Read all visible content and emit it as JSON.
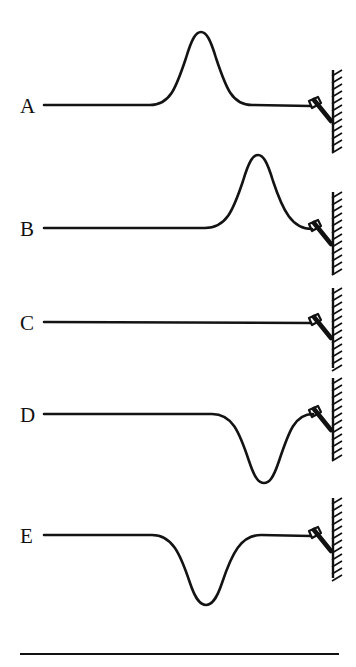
{
  "figure": {
    "width": 356,
    "height": 667,
    "background_color": "#ffffff",
    "line_color": "#131313",
    "wall": {
      "name": "fixed-wall",
      "x": 333,
      "hatch_side": "left",
      "segments": [
        {
          "row": "A",
          "top": 70,
          "bottom": 152
        },
        {
          "row": "B",
          "top": 192,
          "bottom": 275
        },
        {
          "row": "C",
          "top": 288,
          "bottom": 368
        },
        {
          "row": "D",
          "top": 378,
          "bottom": 460
        },
        {
          "row": "E",
          "top": 498,
          "bottom": 578
        }
      ]
    },
    "bottom_rule": {
      "x1": 20,
      "x2": 339,
      "y": 654
    },
    "rows": [
      {
        "label": "A",
        "label_x": 20,
        "label_y": 113,
        "baseline_y": 105,
        "rope_start_x": 44,
        "attach_x": 311,
        "attach_y": 106,
        "pulse": {
          "type": "crest",
          "polarity": "upward",
          "start_x": 150,
          "end_x": 252,
          "peak_x": 201,
          "peak_y": 32,
          "amplitude": 73,
          "width": 102
        }
      },
      {
        "label": "B",
        "label_x": 20,
        "label_y": 236,
        "baseline_y": 228,
        "rope_start_x": 44,
        "attach_x": 311,
        "attach_y": 229,
        "pulse": {
          "type": "crest",
          "polarity": "upward",
          "start_x": 205,
          "end_x": 312,
          "peak_x": 258,
          "peak_y": 155,
          "amplitude": 73,
          "width": 107
        }
      },
      {
        "label": "C",
        "label_x": 20,
        "label_y": 330,
        "baseline_y": 322,
        "rope_start_x": 44,
        "attach_x": 311,
        "attach_y": 323,
        "pulse": {
          "type": "none",
          "polarity": "flat",
          "amplitude": 0,
          "width": 0
        }
      },
      {
        "label": "D",
        "label_x": 20,
        "label_y": 422,
        "baseline_y": 414,
        "rope_start_x": 44,
        "attach_x": 311,
        "attach_y": 415,
        "pulse": {
          "type": "trough",
          "polarity": "downward",
          "start_x": 212,
          "end_x": 313,
          "peak_x": 264,
          "peak_y": 483,
          "amplitude": 69,
          "width": 101
        }
      },
      {
        "label": "E",
        "label_x": 20,
        "label_y": 543,
        "baseline_y": 535,
        "rope_start_x": 44,
        "attach_x": 311,
        "attach_y": 536,
        "pulse": {
          "type": "trough",
          "polarity": "downward",
          "start_x": 152,
          "end_x": 261,
          "peak_x": 206,
          "peak_y": 605,
          "amplitude": 70,
          "width": 109
        }
      }
    ]
  }
}
